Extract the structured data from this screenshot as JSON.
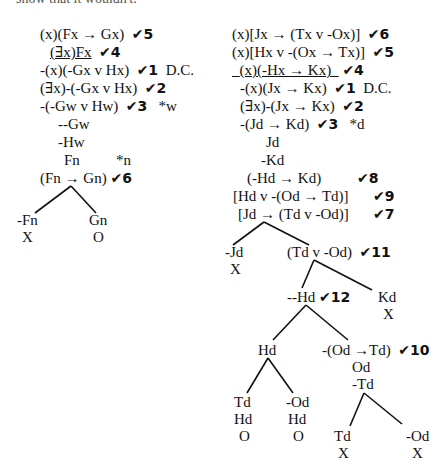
{
  "header": {
    "text": "show that it wouldn't."
  },
  "left_tree": {
    "lines": [
      {
        "text": "(x)(Fx → Gx)",
        "check": "✔5"
      },
      {
        "text": "(∃x)Fx",
        "check": "✔4",
        "underline": true
      },
      {
        "text": "-(x)(-Gx v Hx)",
        "check": "✔1",
        "note": "D.C."
      },
      {
        "text": "(∃x)-(-Gx v Hx)",
        "check": "✔2"
      },
      {
        "text": "-(-Gw v Hw)",
        "check": "✔3",
        "note": "*w"
      },
      {
        "text": "--Gw"
      },
      {
        "text": "-Hw"
      },
      {
        "text": "Fn",
        "note": "*n"
      },
      {
        "text": "(Fn → Gn)",
        "check": "✔6"
      }
    ],
    "branches": [
      {
        "text": "-Fn",
        "status": "X"
      },
      {
        "text": "Gn",
        "status": "O"
      }
    ]
  },
  "right_tree": {
    "lines": [
      {
        "text": "(x)[Jx → (Tx v -Ox)]",
        "check": "✔6"
      },
      {
        "text": "(x)[Hx v -(Ox → Tx)]",
        "check": "✔5"
      },
      {
        "text": "(x)(-Hx → Kx)",
        "check": "✔4",
        "underline": true
      },
      {
        "text": "-(x)(Jx → Kx)",
        "check": "✔1",
        "note": "D.C."
      },
      {
        "text": "(∃x)-(Jx → Kx)",
        "check": "✔2"
      },
      {
        "text": "-(Jd → Kd)",
        "check": "✔3",
        "note": "*d"
      },
      {
        "text": "Jd"
      },
      {
        "text": "-Kd"
      },
      {
        "text": "(-Hd → Kd)",
        "check": "✔8"
      },
      {
        "text": "[Hd v -(Od → Td)]",
        "check": "✔9"
      },
      {
        "text": "[Jd → (Td v -Od)]",
        "check": "✔7"
      }
    ],
    "nodes": {
      "neg_jd": {
        "text": "-Jd",
        "status": "X"
      },
      "td_v_od": {
        "text": "(Td v -Od)",
        "check": "✔11"
      },
      "dneg_hd": {
        "text": "--Hd",
        "check": "✔12"
      },
      "kd": {
        "text": "Kd",
        "status": "X"
      },
      "hd": {
        "text": "Hd"
      },
      "neg_od_td": {
        "text": "-(Od →Td)",
        "check": "✔10",
        "sub": [
          "Od",
          "-Td"
        ]
      },
      "td_hd": {
        "text": "Td",
        "sub": "Hd",
        "status": "O"
      },
      "negod_hd": {
        "text": "-Od",
        "sub": "Hd",
        "status": "O"
      },
      "td_x": {
        "text": "Td",
        "status": "X"
      },
      "negod_x": {
        "text": "-Od",
        "status": "X"
      }
    }
  }
}
